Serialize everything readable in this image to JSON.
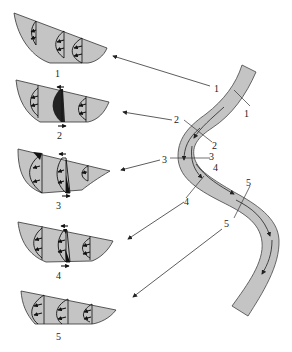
{
  "figure": {
    "colors": {
      "section_fill": "#c4c4c4",
      "outline": "#333333",
      "background": "#ffffff"
    }
  },
  "cross_sections": [
    {
      "id": "1",
      "label": "1"
    },
    {
      "id": "2",
      "label": "2"
    },
    {
      "id": "3",
      "label": "3"
    },
    {
      "id": "4",
      "label": "4"
    },
    {
      "id": "5",
      "label": "5"
    }
  ],
  "channel": {
    "cut_labels": [
      {
        "id": "1",
        "left": "1",
        "right": "1"
      },
      {
        "id": "2",
        "left": "2",
        "right": "2"
      },
      {
        "id": "3",
        "left": "3",
        "right": "3"
      },
      {
        "id": "4",
        "left": "4",
        "right": "4"
      },
      {
        "id": "5",
        "left": "5",
        "right": "5"
      }
    ]
  }
}
